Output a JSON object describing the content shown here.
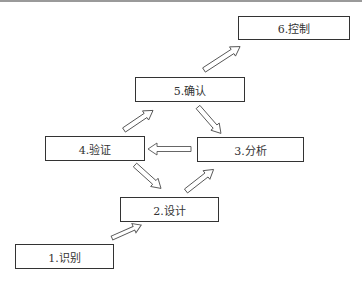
{
  "diagram": {
    "type": "process-flow",
    "nodes": [
      {
        "id": "1",
        "label": "1.识别"
      },
      {
        "id": "2",
        "label": "2.设计"
      },
      {
        "id": "3",
        "label": "3.分析"
      },
      {
        "id": "4",
        "label": "4.验证"
      },
      {
        "id": "5",
        "label": "5.确认"
      },
      {
        "id": "6",
        "label": "6.控制"
      }
    ],
    "edges": [
      {
        "from": "1",
        "to": "2"
      },
      {
        "from": "2",
        "to": "3"
      },
      {
        "from": "3",
        "to": "4"
      },
      {
        "from": "4",
        "to": "2"
      },
      {
        "from": "4",
        "to": "5"
      },
      {
        "from": "5",
        "to": "3"
      },
      {
        "from": "5",
        "to": "6"
      }
    ],
    "colors": {
      "border": "#333333",
      "arrow_fill": "#ffffff",
      "arrow_stroke": "#555555"
    }
  }
}
